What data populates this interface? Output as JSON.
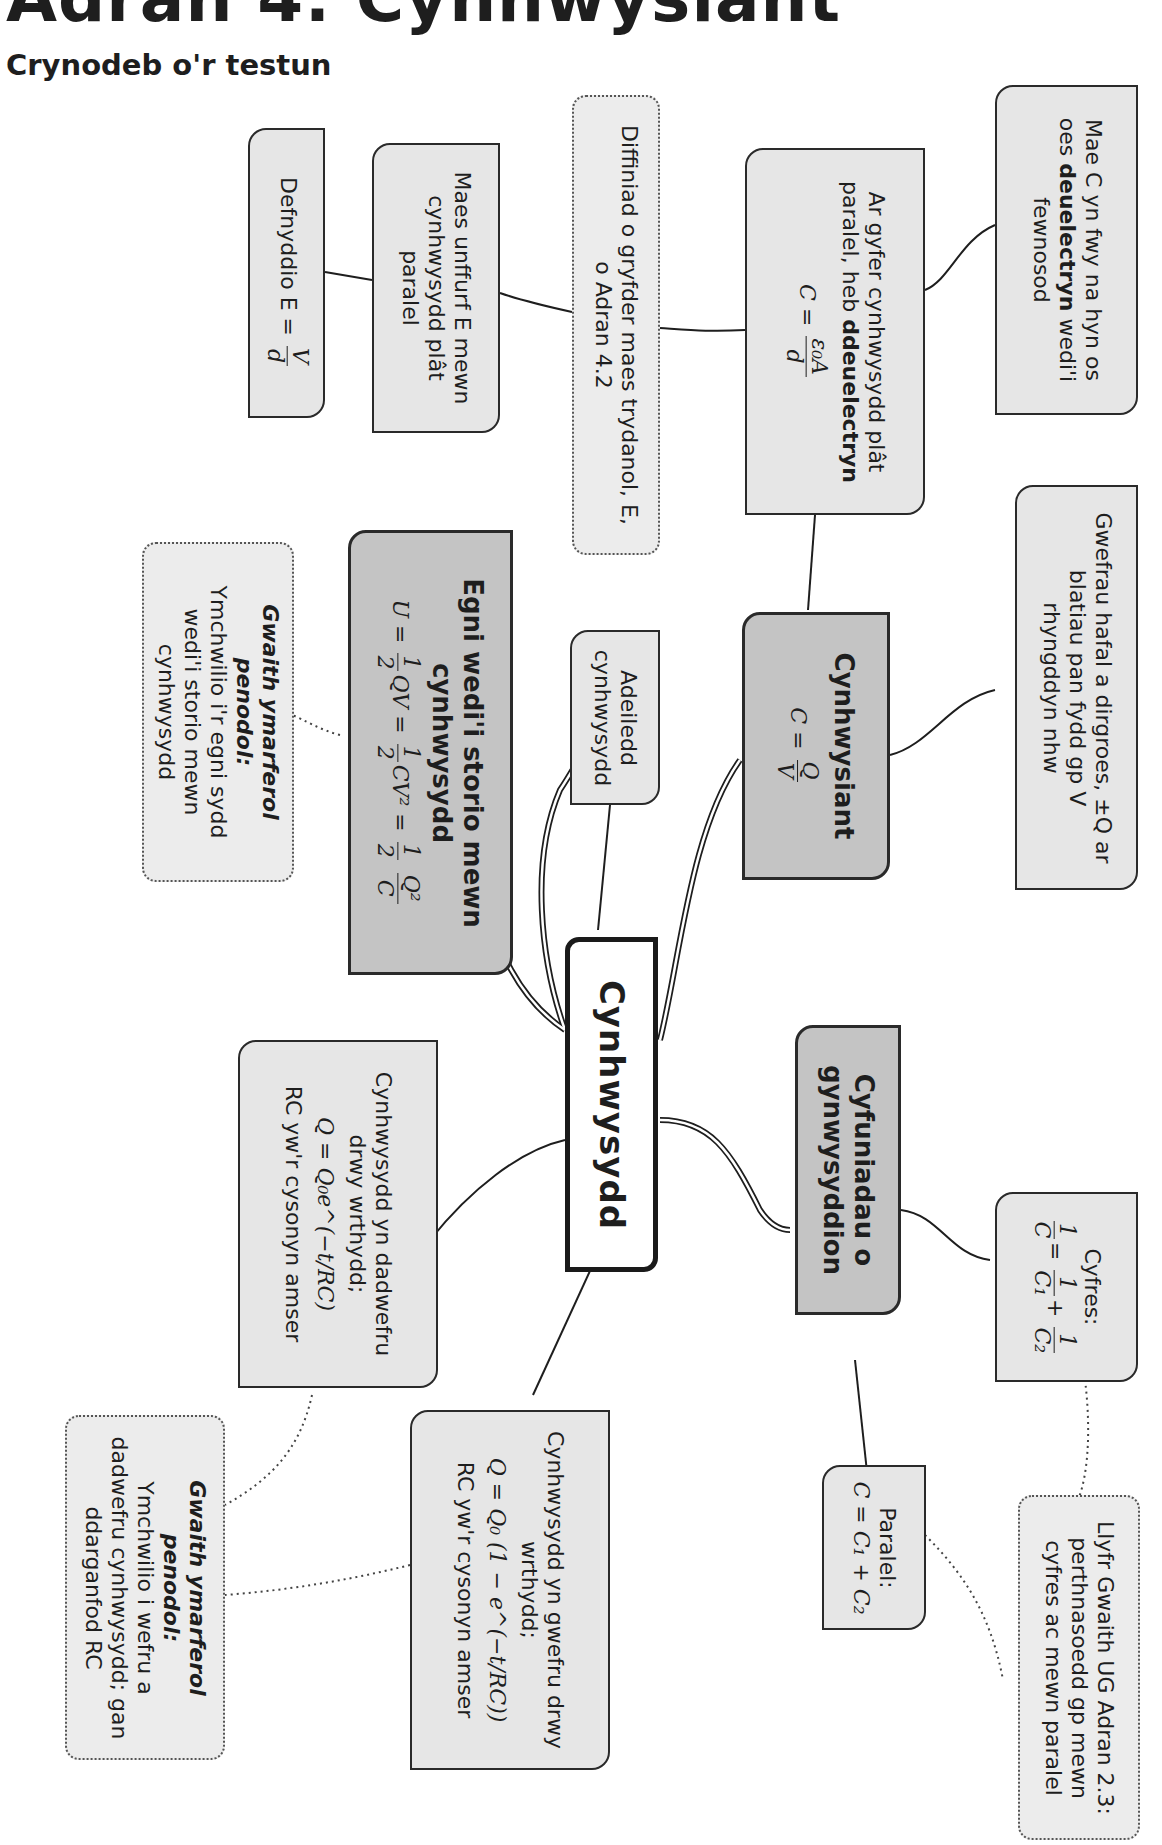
{
  "header": {
    "title": "Adran 4: Cynhwysiant",
    "subtitle": "Crynodeb o'r testun"
  },
  "colors": {
    "box_fill": "#e6e6e6",
    "heading_fill": "#c4c4c4",
    "center_fill": "#ffffff",
    "border": "#2a2a2a"
  },
  "nodes": {
    "center": {
      "label": "Cynhwysydd"
    },
    "capacitance": {
      "label": "Cynhwysiant",
      "formula_lhs": "C =",
      "formula_num": "Q",
      "formula_den": "V"
    },
    "energy": {
      "label": "Egni wedi'i storio mewn cynhwysydd",
      "formula_prefix": "U =",
      "f1_num": "1",
      "f1_den": "2",
      "f1_tail": "QV =",
      "f2_num": "1",
      "f2_den": "2",
      "f2_tail": "CV² =",
      "f3_num": "1",
      "f3_den": "2",
      "f4_num": "Q²",
      "f4_den": "C"
    },
    "combinations": {
      "label": "Cyfuniadau o gynwysyddion"
    },
    "structure": {
      "text": "Adeiledd cynhwysydd"
    },
    "dielectric": {
      "text_pre": "Mae C yn fwy na hyn os oes ",
      "text_bold": "deuelectryn",
      "text_post": " wedi'i fewnosod"
    },
    "parallel_plate": {
      "text_pre": "Ar gyfer cynhwysydd plât paralel, heb ",
      "text_bold": "ddeuelectryn",
      "formula_lhs": "C =",
      "formula_num": "ε₀A",
      "formula_den": "d"
    },
    "field_definition": {
      "text": "Diffiniad o gryfder maes trydanol, E, o Adran 4.2"
    },
    "uniform_field": {
      "text": "Maes unffurf E mewn cynhwysydd plât paralel"
    },
    "use_formula": {
      "text": "Defnyddio E =",
      "formula_num": "V",
      "formula_den": "d"
    },
    "charges": {
      "text": "Gwefrau hafal a dirgroes, ±Q ar blatiau pan fydd gp V rhyngddyn nhw"
    },
    "practical_energy": {
      "heading": "Gwaith ymarferol penodol:",
      "text": "Ymchwilio i'r egni sydd wedi'i storio mewn cynhwysydd"
    },
    "series": {
      "label": "Cyfres:",
      "f_lhs_num": "1",
      "f_lhs_den": "C",
      "f_a_num": "1",
      "f_a_den": "C₁",
      "plus": "+",
      "f_b_num": "1",
      "f_b_den": "C₂"
    },
    "parallel": {
      "label": "Paralel:",
      "formula": "C = C₁ + C₂"
    },
    "workbook": {
      "text": "Llyfr Gwaith UG Adran 2.3: perthnasoedd gp mewn cyfres ac mewn paralel"
    },
    "discharge": {
      "text": "Cynhwysydd yn dadwefru drwy wrthydd;",
      "formula": "Q = Q₀e^(−t/RC)",
      "note": "RC yw'r cysonyn amser"
    },
    "charge": {
      "text": "Cynhwysydd yn gwefru drwy wrthydd;",
      "formula": "Q = Q₀ (1 − e^(−t/RC))",
      "note": "RC yw'r cysonyn amser"
    },
    "practical_rc": {
      "heading": "Gwaith ymarferol penodol:",
      "text": "Ymchwilio i wefru a dadwefru cynhwysydd; gan ddarganfod RC"
    }
  }
}
